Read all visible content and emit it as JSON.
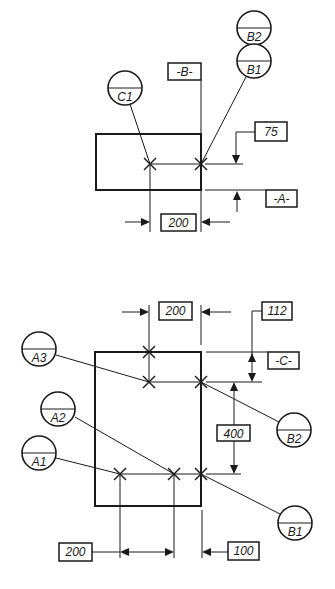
{
  "figure": {
    "colors": {
      "ink": "#1a1a1a",
      "background": "#ffffff"
    },
    "top_view": {
      "datum_targets": [
        {
          "id": "C1",
          "top": "",
          "bottom": "C1"
        },
        {
          "id": "B2",
          "top": "",
          "bottom": "B2"
        },
        {
          "id": "B1",
          "top": "",
          "bottom": "B1"
        }
      ],
      "datum_labels": {
        "B": "-B-",
        "A": "-A-"
      },
      "dimensions": {
        "vertical": "75",
        "horizontal": "200"
      }
    },
    "bottom_view": {
      "datum_targets": [
        {
          "id": "A3",
          "bottom": "A3"
        },
        {
          "id": "A2",
          "bottom": "A2"
        },
        {
          "id": "A1",
          "bottom": "A1"
        },
        {
          "id": "B2",
          "bottom": "B2"
        },
        {
          "id": "B1",
          "bottom": "B1"
        }
      ],
      "datum_labels": {
        "C": "-C-"
      },
      "dimensions": {
        "top_horizontal": "200",
        "top_vertical": "112",
        "middle_vertical": "400",
        "bottom_left_horizontal": "200",
        "bottom_right_horizontal": "100"
      }
    }
  }
}
